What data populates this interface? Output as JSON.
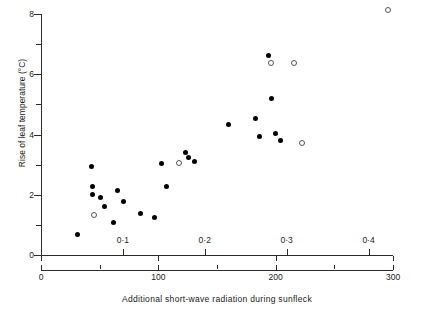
{
  "chart_data": {
    "type": "scatter",
    "title": "",
    "xlabel": "Additional short-wave radiation during sunfleck",
    "ylabel": "Rise of leaf temperature (°C)",
    "x_units_primary": "cal cm⁻² min⁻¹",
    "x_units_secondary": "W m⁻²",
    "xlim_wm2": [
      0,
      430
    ],
    "ylim": [
      0,
      8
    ],
    "grid": false,
    "legend": "none",
    "axes": {
      "y_ticks_major": [
        0,
        2,
        4,
        6,
        8
      ],
      "y_ticks_minor": [
        1,
        3,
        5,
        7
      ],
      "y_tick_labels": [
        "0",
        "2",
        "4",
        "6",
        "8"
      ],
      "x_ticks_wm2_major": [
        0,
        100,
        200,
        300
      ],
      "x_tick_labels_wm2": [
        "0",
        "100",
        "200",
        "300"
      ],
      "x_ticks_cal_major": [
        0.1,
        0.2,
        0.3,
        0.4,
        0.5
      ],
      "x_tick_labels_cal": [
        "0·1",
        "0·2",
        "0·3",
        "0·4",
        "0·5"
      ],
      "cal_to_wm2": 697.8
    },
    "series": [
      {
        "name": "filled",
        "marker": "filled-circle",
        "color": "#000000",
        "points": [
          {
            "x_wm2": 31,
            "y": 0.68
          },
          {
            "x_wm2": 43,
            "y": 2.93
          },
          {
            "x_wm2": 44,
            "y": 2.28
          },
          {
            "x_wm2": 44,
            "y": 2.02
          },
          {
            "x_wm2": 51,
            "y": 1.9
          },
          {
            "x_wm2": 54,
            "y": 1.6
          },
          {
            "x_wm2": 62,
            "y": 1.08
          },
          {
            "x_wm2": 65,
            "y": 2.13
          },
          {
            "x_wm2": 70,
            "y": 1.76
          },
          {
            "x_wm2": 85,
            "y": 1.37
          },
          {
            "x_wm2": 97,
            "y": 1.25
          },
          {
            "x_wm2": 103,
            "y": 3.03
          },
          {
            "x_wm2": 107,
            "y": 2.28
          },
          {
            "x_wm2": 123,
            "y": 3.4
          },
          {
            "x_wm2": 126,
            "y": 3.22
          },
          {
            "x_wm2": 131,
            "y": 3.12
          },
          {
            "x_wm2": 160,
            "y": 4.33
          },
          {
            "x_wm2": 183,
            "y": 4.53
          },
          {
            "x_wm2": 186,
            "y": 3.92
          },
          {
            "x_wm2": 194,
            "y": 6.63
          },
          {
            "x_wm2": 196,
            "y": 5.18
          },
          {
            "x_wm2": 200,
            "y": 4.02
          },
          {
            "x_wm2": 204,
            "y": 3.8
          }
        ]
      },
      {
        "name": "open",
        "marker": "open-circle",
        "color": "#555555",
        "points": [
          {
            "x_wm2": 45,
            "y": 1.33
          },
          {
            "x_wm2": 118,
            "y": 3.07
          },
          {
            "x_wm2": 196,
            "y": 6.37
          },
          {
            "x_wm2": 216,
            "y": 6.38
          },
          {
            "x_wm2": 222,
            "y": 3.72
          },
          {
            "x_wm2": 296,
            "y": 8.12
          }
        ]
      }
    ]
  },
  "figure": {
    "y_axis_title": "Rise of leaf temperature (°C)",
    "x_axis_title": "Additional short-wave radiation during sunfleck",
    "unit_cal_prefix": "cal cm",
    "unit_cal_sup1": "-2",
    "unit_cal_mid": " min",
    "unit_cal_sup2": "-1",
    "unit_wm_prefix": "W m",
    "unit_wm_sup": "-2"
  }
}
